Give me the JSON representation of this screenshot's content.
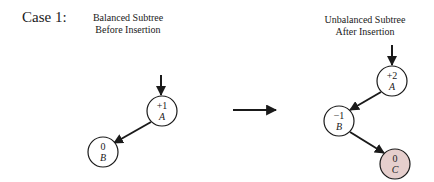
{
  "case_label": "Case 1:",
  "captions": {
    "before": [
      "Balanced Subtree",
      "Before Insertion"
    ],
    "after": [
      "Unbalanced Subtree",
      "After Insertion"
    ]
  },
  "colors": {
    "stroke": "#1a1a1a",
    "node_fill": "#ffffff",
    "inserted_fill": "#e6cfcd"
  },
  "before_tree": {
    "nodes": [
      {
        "id": "A",
        "balance": "+1",
        "label": "A"
      },
      {
        "id": "B",
        "balance": "0",
        "label": "B"
      }
    ],
    "edges": [
      [
        "A",
        "B"
      ]
    ]
  },
  "after_tree": {
    "nodes": [
      {
        "id": "A",
        "balance": "+2",
        "label": "A"
      },
      {
        "id": "B",
        "balance": "−1",
        "label": "B"
      },
      {
        "id": "C",
        "balance": "0",
        "label": "C",
        "inserted": true
      }
    ],
    "edges": [
      [
        "A",
        "B"
      ],
      [
        "B",
        "C"
      ]
    ]
  }
}
